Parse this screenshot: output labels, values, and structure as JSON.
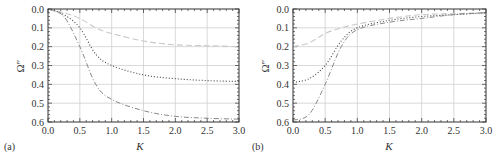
{
  "chart_data": [
    {
      "type": "line",
      "panel_label": "(a)",
      "xlabel": "K",
      "ylabel": "Ω″",
      "xlim": [
        0,
        3
      ],
      "ylim": [
        0.6,
        0.0
      ],
      "y_inverted": true,
      "grid": true,
      "x_ticks": [
        "0.0",
        "0.5",
        "1.0",
        "1.5",
        "2.0",
        "2.5",
        "3.0"
      ],
      "y_ticks": [
        "0.0",
        "0.1",
        "0.2",
        "0.3",
        "0.4",
        "0.5",
        "0.6"
      ],
      "x": [
        0,
        0.25,
        0.5,
        0.75,
        1.0,
        1.5,
        2.0,
        2.5,
        3.0
      ],
      "series": [
        {
          "name": "dashed",
          "style": "dashed",
          "values": [
            0,
            0.02,
            0.05,
            0.1,
            0.13,
            0.17,
            0.19,
            0.195,
            0.2
          ]
        },
        {
          "name": "dotted",
          "style": "dotted",
          "values": [
            0,
            0.03,
            0.1,
            0.24,
            0.3,
            0.35,
            0.37,
            0.38,
            0.385
          ]
        },
        {
          "name": "dash-dot",
          "style": "dashdot",
          "values": [
            0,
            0.04,
            0.2,
            0.4,
            0.48,
            0.54,
            0.57,
            0.58,
            0.585
          ]
        }
      ]
    },
    {
      "type": "line",
      "panel_label": "(b)",
      "xlabel": "K",
      "ylabel": "Ω″",
      "xlim": [
        0,
        3
      ],
      "ylim": [
        0.6,
        0.0
      ],
      "y_inverted": true,
      "grid": true,
      "x_ticks": [
        "0.0",
        "0.5",
        "1.0",
        "1.5",
        "2.0",
        "2.5",
        "3.0"
      ],
      "y_ticks": [
        "0.0",
        "0.1",
        "0.2",
        "0.3",
        "0.4",
        "0.5",
        "0.6"
      ],
      "x": [
        0,
        0.25,
        0.5,
        0.75,
        1.0,
        1.5,
        2.0,
        2.5,
        3.0
      ],
      "series": [
        {
          "name": "dashed",
          "style": "dashed",
          "values": [
            0.2,
            0.18,
            0.13,
            0.1,
            0.08,
            0.05,
            0.03,
            0.025,
            0.02
          ]
        },
        {
          "name": "dotted",
          "style": "dotted",
          "values": [
            0.39,
            0.37,
            0.3,
            0.17,
            0.1,
            0.06,
            0.04,
            0.03,
            0.02
          ]
        },
        {
          "name": "dash-dot",
          "style": "dashdot",
          "values": [
            0.59,
            0.56,
            0.4,
            0.2,
            0.11,
            0.07,
            0.05,
            0.03,
            0.02
          ]
        }
      ]
    }
  ],
  "panels": [
    {
      "label": "(a)",
      "xlabel": "K",
      "ylabel": "Ω″"
    },
    {
      "label": "(b)",
      "xlabel": "K",
      "ylabel": "Ω″"
    }
  ]
}
